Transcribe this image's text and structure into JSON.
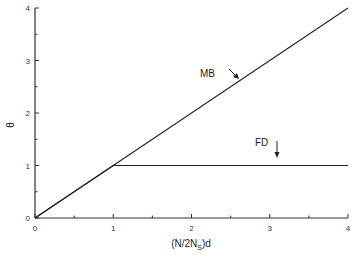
{
  "chart_data": {
    "type": "line",
    "title": "",
    "xlabel": "(N/2N_S)d",
    "xlabel_main": "(N/2N",
    "xlabel_sub": "S",
    "xlabel_tail": ")d",
    "ylabel": "θ",
    "xlim": [
      0,
      4
    ],
    "ylim": [
      0,
      4
    ],
    "x_ticks": [
      "0",
      "1",
      "2",
      "3",
      "4"
    ],
    "y_ticks": [
      "0",
      "1",
      "2",
      "3",
      "4"
    ],
    "grid": false,
    "legend": null,
    "series": [
      {
        "name": "MB",
        "x": [
          0,
          4
        ],
        "y": [
          0,
          4
        ]
      },
      {
        "name": "FD",
        "x": [
          0,
          1,
          4
        ],
        "y": [
          0,
          1,
          1
        ]
      }
    ],
    "annotations": [
      {
        "text": "MB",
        "arrow": "down-right",
        "points_to": [
          2.6,
          2.6
        ]
      },
      {
        "text": "FD",
        "arrow": "down",
        "points_to": [
          3.1,
          1.0
        ]
      }
    ]
  }
}
